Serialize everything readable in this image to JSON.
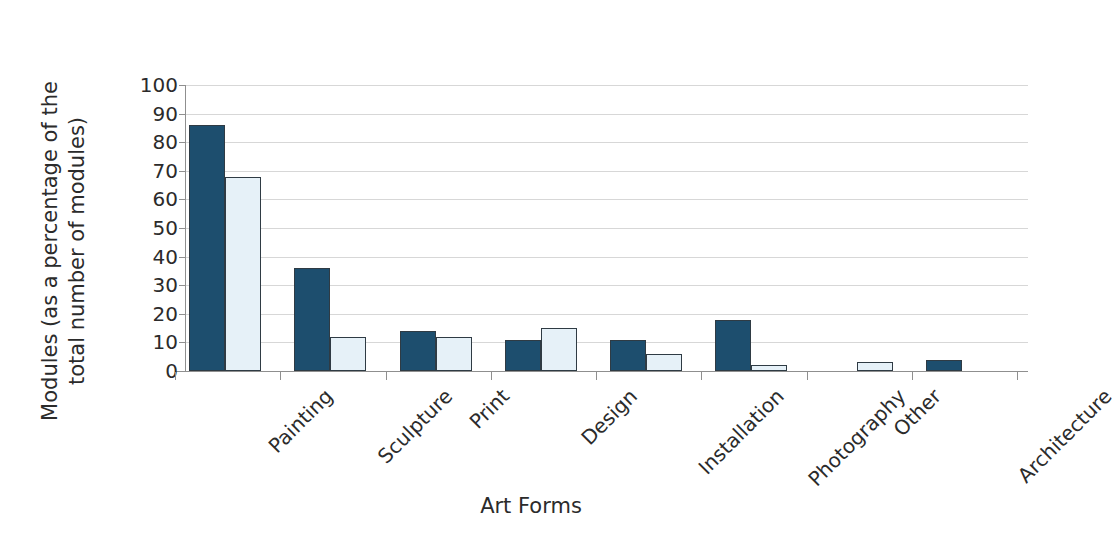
{
  "chart_data": {
    "type": "bar",
    "title": "",
    "xlabel": "Art Forms",
    "ylabel": "Modules (as a percentage of the total number of modules)",
    "ylabel_line1": "Modules (as a percentage of the",
    "ylabel_line2": "total number of modules)",
    "categories": [
      "Painting",
      "Sculpture",
      "Print",
      "Design",
      "Installation",
      "Photography",
      "Other",
      "Architecture"
    ],
    "series": [
      {
        "name": "series-1",
        "color": "#1d4e6e",
        "values": [
          86,
          36,
          14,
          11,
          11,
          18,
          0,
          4
        ]
      },
      {
        "name": "series-2",
        "color": "#e6f1f8",
        "values": [
          68,
          12,
          12,
          15,
          6,
          2,
          3,
          0
        ]
      }
    ],
    "ylim": [
      0,
      100
    ],
    "y_ticks": [
      0,
      10,
      20,
      30,
      40,
      50,
      60,
      70,
      80,
      90,
      100
    ],
    "y_tick_labels": [
      "0",
      "10",
      "20",
      "30",
      "40",
      "50",
      "60",
      "70",
      "80",
      "90",
      "100"
    ],
    "grid": true,
    "grid_axis": "y",
    "grid_color": "#d7d7d7",
    "legend": false,
    "bar_edge_color": "#2f3b44",
    "axis_color": "#8f8f8f",
    "background": "#ffffff",
    "x_tick_label_rotation": -45
  }
}
